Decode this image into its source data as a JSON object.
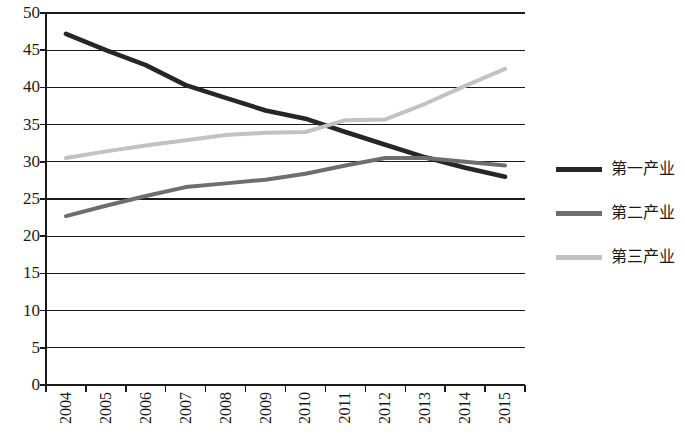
{
  "chart_data": {
    "type": "line",
    "title": "",
    "subtitle": "",
    "xlabel": "",
    "ylabel": "",
    "categories": [
      "2004",
      "2005",
      "2006",
      "2007",
      "2008",
      "2009",
      "2010",
      "2011",
      "2012",
      "2013",
      "2014",
      "2015"
    ],
    "ylim": [
      0,
      50
    ],
    "ytick_step": 5,
    "yticks": [
      "50",
      "45",
      "40",
      "35",
      "30",
      "25",
      "20",
      "15",
      "10",
      "5",
      "0"
    ],
    "grid": "horizontal",
    "legend_position": "right",
    "series": [
      {
        "name": "第一产业",
        "color": "#262626",
        "values": [
          47.2,
          45.0,
          43.0,
          40.3,
          38.6,
          36.9,
          35.8,
          34.0,
          32.3,
          30.6,
          29.2,
          28.0
        ]
      },
      {
        "name": "第二产业",
        "color": "#6e6e6e",
        "values": [
          22.7,
          24.1,
          25.4,
          26.6,
          27.1,
          27.6,
          28.4,
          29.5,
          30.5,
          30.5,
          30.0,
          29.5
        ]
      },
      {
        "name": "第三产业",
        "color": "#c2c2c2",
        "values": [
          30.5,
          31.4,
          32.2,
          32.9,
          33.6,
          33.9,
          34.0,
          35.6,
          35.7,
          37.8,
          40.2,
          42.5
        ]
      }
    ]
  },
  "legend": {
    "items": [
      {
        "label": "第一产业",
        "color": "#262626",
        "swatch": "line-solid-dark"
      },
      {
        "label": "第二产业",
        "color": "#6e6e6e",
        "swatch": "line-solid-mid"
      },
      {
        "label": "第三产业",
        "color": "#c2c2c2",
        "swatch": "line-solid-light"
      }
    ]
  },
  "axes": {
    "y": {
      "min": 0,
      "max": 50,
      "step": 5
    },
    "x": {
      "tick_count": 12
    }
  },
  "colors": {
    "axis": "#1a1a1a",
    "grid": "#1a1a1a",
    "background": "#ffffff"
  }
}
